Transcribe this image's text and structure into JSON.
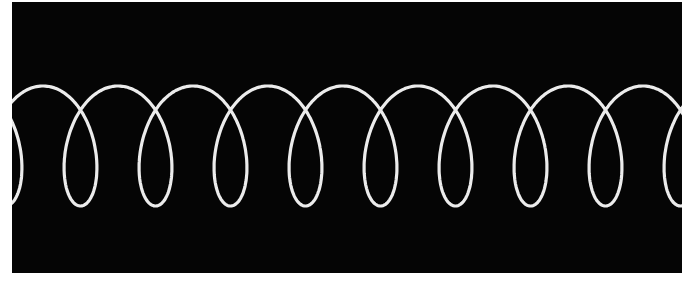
{
  "image": {
    "description": "Photograph of a bright looping trace (prolate trochoid / spiral curve) on a black background",
    "background_color": "#050505",
    "trace_color": "#ececec",
    "frame_color": "#ffffff"
  },
  "trace": {
    "loop_count_visible": 9,
    "period_px": 75,
    "crossing_x": [
      43,
      117,
      191,
      267,
      342,
      418,
      491,
      566,
      641
    ],
    "top_y": 86,
    "bottom_y": 206,
    "stroke_width": 3.2
  }
}
